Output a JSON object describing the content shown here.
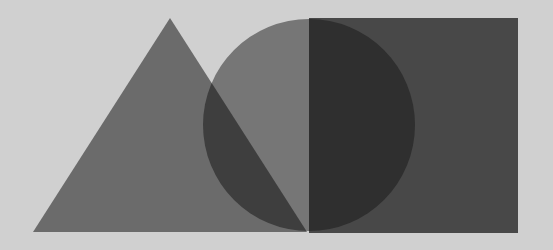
{
  "canvas": {
    "width": 553,
    "height": 250,
    "background": "#d0d0d0"
  },
  "shapes": {
    "triangle": {
      "points": "33,232 170,18 307,232",
      "fill": "#6b6b6b"
    },
    "circle": {
      "cx": 309,
      "cy": 125,
      "r": 106,
      "fill": "#767676"
    },
    "square": {
      "x": 309,
      "y": 18,
      "width": 209,
      "height": 215,
      "fill": "#484848"
    },
    "overlap_circle_triangle": {
      "fill": "#3e3e3e"
    },
    "overlap_circle_square": {
      "fill": "#2f2f2f"
    }
  }
}
